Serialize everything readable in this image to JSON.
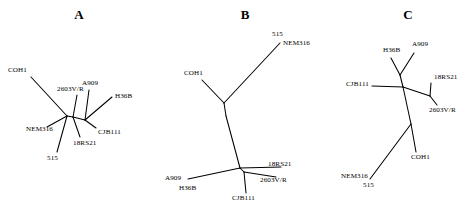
{
  "figure": {
    "background_color": "#ffffff",
    "line_color": "#000000",
    "text_color": "#000000",
    "width": 475,
    "height": 210
  },
  "panels": [
    {
      "id": "a",
      "letter": "A",
      "letter_x": 69,
      "letter_y": 8,
      "taxa": [
        {
          "name": "COH1",
          "label_x": 8,
          "label_y": 72,
          "anchor": "start",
          "tip_x": 30,
          "tip_y": 76
        },
        {
          "name": "2603V/R",
          "label_x": 57,
          "label_y": 91,
          "anchor": "start",
          "tip_x": 74,
          "tip_y": 93
        },
        {
          "name": "A909",
          "label_x": 82,
          "label_y": 85,
          "anchor": "start",
          "tip_x": 86,
          "tip_y": 87
        },
        {
          "name": "H36B",
          "label_x": 115,
          "label_y": 98,
          "anchor": "start",
          "tip_x": 113,
          "tip_y": 98
        },
        {
          "name": "CJB111",
          "label_x": 98,
          "label_y": 134,
          "anchor": "start",
          "tip_x": 97,
          "tip_y": 129
        },
        {
          "name": "18RS21",
          "label_x": 73,
          "label_y": 145,
          "anchor": "start",
          "tip_x": 82,
          "tip_y": 139
        },
        {
          "name": "515",
          "label_x": 47,
          "label_y": 160,
          "anchor": "start",
          "tip_x": 54,
          "tip_y": 154
        },
        {
          "name": "NEM316",
          "label_x": 26,
          "label_y": 131,
          "anchor": "start",
          "tip_x": 49,
          "tip_y": 128
        }
      ],
      "branches": [
        {
          "points": "31,77 67,116"
        },
        {
          "points": "67,116 47,127"
        },
        {
          "points": "67,116 73,117"
        },
        {
          "points": "73,117 77,95"
        },
        {
          "points": "73,117 85,120"
        },
        {
          "points": "85,120 89,90"
        },
        {
          "points": "85,120 112,97"
        },
        {
          "points": "85,120 96,128"
        },
        {
          "points": "73,117 80,137"
        },
        {
          "points": "67,116 57,152"
        }
      ]
    },
    {
      "id": "b",
      "letter": "B",
      "letter_x": 235,
      "letter_y": 8,
      "taxa": [
        {
          "name": "515",
          "label_x": 272,
          "label_y": 36,
          "anchor": "start",
          "tip_x": 280,
          "tip_y": 42
        },
        {
          "name": "NEM316",
          "label_x": 283,
          "label_y": 45,
          "anchor": "start",
          "tip_x": 281,
          "tip_y": 44
        },
        {
          "name": "COH1",
          "label_x": 184,
          "label_y": 75,
          "anchor": "start",
          "tip_x": 201,
          "tip_y": 79
        },
        {
          "name": "18RS21",
          "label_x": 268,
          "label_y": 166,
          "anchor": "start",
          "tip_x": 282,
          "tip_y": 167
        },
        {
          "name": "2603V/R",
          "label_x": 260,
          "label_y": 182,
          "anchor": "start",
          "tip_x": 277,
          "tip_y": 178
        },
        {
          "name": "CJB111",
          "label_x": 232,
          "label_y": 200,
          "anchor": "start",
          "tip_x": 246,
          "tip_y": 194
        },
        {
          "name": "A909",
          "label_x": 165,
          "label_y": 180,
          "anchor": "start",
          "tip_x": 187,
          "tip_y": 178
        },
        {
          "name": "H36B",
          "label_x": 179,
          "label_y": 190,
          "anchor": "start",
          "tip_x": 189,
          "tip_y": 182
        }
      ],
      "branches": [
        {
          "points": "280,43 224,103"
        },
        {
          "points": "224,103 202,80"
        },
        {
          "points": "224,103 226,116"
        },
        {
          "points": "226,116 240,168"
        },
        {
          "points": "240,168 188,179"
        },
        {
          "points": "240,168 281,167"
        },
        {
          "points": "240,168 244,172"
        },
        {
          "points": "244,172 276,177"
        },
        {
          "points": "244,172 246,193"
        }
      ]
    },
    {
      "id": "c",
      "letter": "C",
      "letter_x": 398,
      "letter_y": 8,
      "taxa": [
        {
          "name": "H36B",
          "label_x": 383,
          "label_y": 52,
          "anchor": "start",
          "tip_x": 390,
          "tip_y": 57
        },
        {
          "name": "A909",
          "label_x": 412,
          "label_y": 46,
          "anchor": "start",
          "tip_x": 414,
          "tip_y": 52
        },
        {
          "name": "CJB111",
          "label_x": 346,
          "label_y": 86,
          "anchor": "start",
          "tip_x": 372,
          "tip_y": 85
        },
        {
          "name": "18RS21",
          "label_x": 434,
          "label_y": 79,
          "anchor": "start",
          "tip_x": 432,
          "tip_y": 82
        },
        {
          "name": "2603V/R",
          "label_x": 429,
          "label_y": 112,
          "anchor": "start",
          "tip_x": 437,
          "tip_y": 106
        },
        {
          "name": "COH1",
          "label_x": 411,
          "label_y": 159,
          "anchor": "start",
          "tip_x": 416,
          "tip_y": 153
        },
        {
          "name": "NEM316",
          "label_x": 341,
          "label_y": 178,
          "anchor": "start",
          "tip_x": 369,
          "tip_y": 179
        },
        {
          "name": "515",
          "label_x": 363,
          "label_y": 187,
          "anchor": "start",
          "tip_x": 370,
          "tip_y": 180
        }
      ],
      "branches": [
        {
          "points": "391,58 400,75"
        },
        {
          "points": "400,75 414,53"
        },
        {
          "points": "400,75 403,87"
        },
        {
          "points": "403,87 372,86"
        },
        {
          "points": "403,87 430,96"
        },
        {
          "points": "430,96 431,83"
        },
        {
          "points": "430,96 437,105"
        },
        {
          "points": "403,87 411,124"
        },
        {
          "points": "411,124 416,152"
        },
        {
          "points": "411,124 370,179"
        }
      ]
    }
  ]
}
